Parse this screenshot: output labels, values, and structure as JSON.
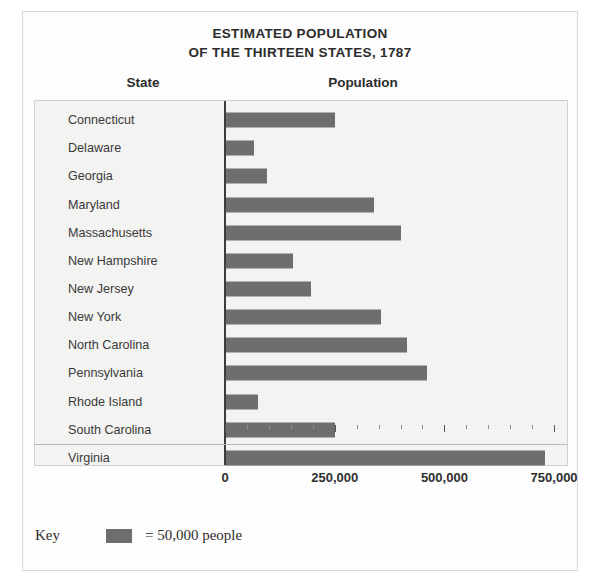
{
  "title": {
    "line1": "ESTIMATED POPULATION",
    "line2": "OF THE THIRTEEN STATES, 1787"
  },
  "headers": {
    "state": "State",
    "population": "Population"
  },
  "key": {
    "label": "Key",
    "text": "= 50,000 people",
    "swatch_color": "#6e6e6e",
    "unit_value": 50000
  },
  "style": {
    "bar_color": "#6e6e6e",
    "plot_background": "#f3f3f1",
    "axis_color": "#3d3d3d",
    "frame_border": "#cfcfcf",
    "outer_border": "#d8d8d8",
    "text_color": "#2c2c2c"
  },
  "chart_data": {
    "type": "bar",
    "orientation": "horizontal",
    "title": "ESTIMATED POPULATION OF THE THIRTEEN STATES, 1787",
    "xlabel": "Population",
    "ylabel": "State",
    "xlim": [
      0,
      790000
    ],
    "xticks": [
      0,
      250000,
      500000,
      750000
    ],
    "xticklabels": [
      "0",
      "250,000",
      "500,000",
      "750,000"
    ],
    "xtick_minor_step": 50000,
    "grid": false,
    "legend": "= 50,000 people",
    "legend_position": "below-axes-left",
    "categories": [
      "Connecticut",
      "Delaware",
      "Georgia",
      "Maryland",
      "Massachusetts",
      "New Hampshire",
      "New Jersey",
      "New York",
      "North Carolina",
      "Pennsylvania",
      "Rhode Island",
      "South Carolina",
      "Virginia"
    ],
    "values": [
      250000,
      65000,
      95000,
      340000,
      400000,
      155000,
      195000,
      355000,
      415000,
      460000,
      75000,
      250000,
      730000
    ]
  }
}
